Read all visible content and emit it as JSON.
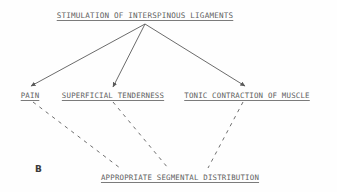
{
  "figure": {
    "panel_letter": "B",
    "background_color": "#fefefe",
    "ink_color": "#4a4a4a"
  },
  "diagram": {
    "title_node": {
      "label": "STIMULATION OF INTERSPINOUS LIGAMENTS",
      "x": 145,
      "y": 18
    },
    "branch_nodes": [
      {
        "label": "PAIN",
        "x": 30,
        "y": 96
      },
      {
        "label": "SUPERFICIAL TENDERNESS",
        "x": 113,
        "y": 96
      },
      {
        "label": "TONIC CONTRACTION OF MUSCLE",
        "x": 247,
        "y": 96
      }
    ],
    "outcome_node": {
      "label": "APPROPRIATE SEGMENTAL DISTRIBUTION",
      "x": 180,
      "y": 178
    },
    "solid_arrows": [
      {
        "from_x": 145,
        "from_y": 24,
        "to_x": 31,
        "to_y": 86,
        "style": "solid",
        "arrowhead": true
      },
      {
        "from_x": 145,
        "from_y": 24,
        "to_x": 113,
        "to_y": 87,
        "style": "solid",
        "arrowhead": true
      },
      {
        "from_x": 145,
        "from_y": 24,
        "to_x": 245,
        "to_y": 86,
        "style": "solid",
        "arrowhead": true
      }
    ],
    "dashed_links": [
      {
        "from_x": 33,
        "from_y": 102,
        "to_x": 120,
        "to_y": 168,
        "style": "dashed",
        "arrowhead": false
      },
      {
        "from_x": 113,
        "from_y": 102,
        "to_x": 168,
        "to_y": 168,
        "style": "dashed",
        "arrowhead": false
      },
      {
        "from_x": 243,
        "from_y": 102,
        "to_x": 208,
        "to_y": 168,
        "style": "dashed",
        "arrowhead": false
      }
    ]
  }
}
